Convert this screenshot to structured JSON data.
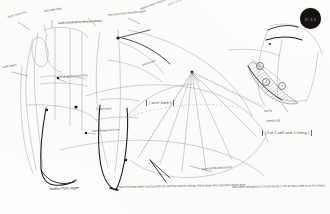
{
  "sheet": {
    "title": "Hand-drawn garment pattern drafting sketch",
    "medium": "pencil and ink on white paper",
    "paper_color": "#fdfdfc",
    "ink_color": "#1f1f21",
    "pencil_color": "#8a8a8d"
  },
  "stamp": {
    "name": "corner-stamp",
    "label": "0–13",
    "fill": "#14110f",
    "text_color": "#9a938d"
  },
  "annotations": {
    "top_left_1": "front neck line",
    "top_left_2": "shoulder dart",
    "top_center_1": "slash and pivot to release fullness",
    "top_center_2": "measure from shoulder point",
    "top_right_1": "extend seam line to match",
    "top_right_2": "notch at bust",
    "left_mid": "side seam",
    "left_lower": "hem allowance 2 cm",
    "center_mid": "true up the waist line",
    "center_low": "[ slash line ]",
    "center_label": "[ skirt flare ]",
    "pivot_note": "pivot point",
    "fan_note": "flare distributed evenly",
    "right_note_1": "facing",
    "right_note_2": "interfacing",
    "right_bracket": "[ cut 2 self and 2 lining ]",
    "bottom_caption": "bodice front sloper",
    "bottom_line_left": "trace the new seam and transfer all notches before cutting; check grain line matches centre front",
    "bottom_line_right": "add seam allowance 1 cm all round, 3 cm at hem, then true all corners"
  },
  "circled_numbers": [
    "1",
    "2",
    "3"
  ],
  "markers": {
    "pivot_dot": "pivot-point-marker",
    "notch_dot": "notch-marker"
  }
}
